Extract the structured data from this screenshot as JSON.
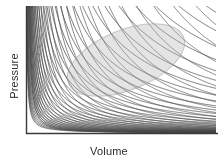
{
  "figure": {
    "width": 218,
    "height": 166,
    "background_color": "#ffffff",
    "axis_color": "#3a3a3a",
    "curve_color": "#4a4a4a",
    "highlight_color": "#b8b8b8",
    "label_color": "#2b2b2b"
  },
  "axes": {
    "x_label": "Volume",
    "y_label": "Pressure",
    "x_axis_pixel_y": 133,
    "y_axis_pixel_x": 26,
    "plot_left": 26,
    "plot_right": 216,
    "plot_top": 6,
    "plot_bottom": 133,
    "ticks_visible": false,
    "tick_labels_visible": false,
    "grid": false
  },
  "highlight_region": {
    "shape": "ellipse",
    "center_x": 126,
    "center_y": 60,
    "radius_x": 62,
    "radius_y": 30,
    "rotation_deg": -22,
    "fill": "#b0b0b0",
    "fill_opacity": 0.34,
    "stroke": "#9a9a9a",
    "stroke_opacity": 0.55,
    "stroke_width": 1
  },
  "chart_data": {
    "type": "line",
    "title": "",
    "subtitle": "",
    "xlabel": "Volume",
    "ylabel": "Pressure",
    "xlim": [
      0,
      1
    ],
    "ylim": [
      0,
      1
    ],
    "grid": false,
    "legend": "none",
    "annotations": [
      {
        "type": "ellipse",
        "label": "highlighted region",
        "center": [
          0.53,
          0.58
        ],
        "width": 0.62,
        "height": 0.36,
        "angle_deg": -22
      }
    ],
    "curve_family": {
      "relation": "P = k / V",
      "count": 34,
      "k_min": 0.004,
      "k_max": 0.95,
      "k_spacing": "geometric",
      "series": [
        {
          "name": "isotherm-01",
          "k": 0.004
        },
        {
          "name": "isotherm-02",
          "k": 0.0055
        },
        {
          "name": "isotherm-03",
          "k": 0.0075
        },
        {
          "name": "isotherm-04",
          "k": 0.0102
        },
        {
          "name": "isotherm-05",
          "k": 0.0138
        },
        {
          "name": "isotherm-06",
          "k": 0.0186
        },
        {
          "name": "isotherm-07",
          "k": 0.0249
        },
        {
          "name": "isotherm-08",
          "k": 0.0332
        },
        {
          "name": "isotherm-09",
          "k": 0.0441
        },
        {
          "name": "isotherm-10",
          "k": 0.0583
        },
        {
          "name": "isotherm-11",
          "k": 0.0766
        },
        {
          "name": "isotherm-12",
          "k": 0.1001
        },
        {
          "name": "isotherm-13",
          "k": 0.13
        },
        {
          "name": "isotherm-14",
          "k": 0.1677
        },
        {
          "name": "isotherm-15",
          "k": 0.2148
        },
        {
          "name": "isotherm-16",
          "k": 0.273
        },
        {
          "name": "isotherm-17",
          "k": 0.344
        },
        {
          "name": "isotherm-18",
          "k": 0.429
        },
        {
          "name": "isotherm-19",
          "k": 0.528
        },
        {
          "name": "isotherm-20",
          "k": 0.64
        },
        {
          "name": "isotherm-21",
          "k": 0.76
        },
        {
          "name": "isotherm-22",
          "k": 0.88
        },
        {
          "name": "isotherm-23",
          "k": 0.95
        }
      ]
    },
    "secondary_family": {
      "description": "Steep descending branches crossing the isotherms from upper-left toward lower-right, forming the cross-hatched moire pattern",
      "count": 30,
      "relation": "adiabat-like P = c / V^1.4"
    }
  }
}
